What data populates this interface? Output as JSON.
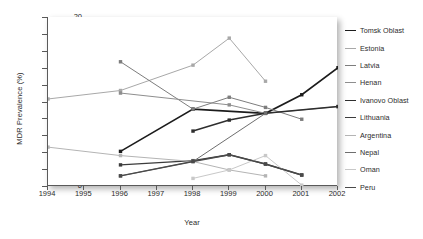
{
  "chart_data": {
    "type": "line",
    "title": "",
    "xlabel": "Year",
    "ylabel": "MDR Prevalence (%)",
    "xlim": [
      1994,
      2002
    ],
    "ylim": [
      0,
      20
    ],
    "ytick_step": 2,
    "yticks": [
      0,
      2,
      4,
      6,
      8,
      10,
      12,
      14,
      16,
      18,
      20
    ],
    "xticks": [
      1994,
      1995,
      1996,
      1997,
      1998,
      1999,
      2000,
      2001,
      2002
    ],
    "grid": false,
    "legend_position": "right",
    "marker": "square",
    "series": [
      {
        "name": "Tomsk Oblast",
        "color": "#1c1c1c",
        "width": 1.6,
        "points": [
          [
            1996,
            4.1
          ],
          [
            1998,
            9.1
          ],
          [
            2000,
            8.6
          ],
          [
            2001,
            10.8
          ],
          [
            2002,
            14.0
          ]
        ]
      },
      {
        "name": "Estonia",
        "color": "#a8a8a8",
        "width": 1.0,
        "points": [
          [
            1994,
            10.3
          ],
          [
            1996,
            11.3
          ],
          [
            1998,
            14.3
          ],
          [
            1999,
            17.5
          ],
          [
            2000,
            12.4
          ]
        ]
      },
      {
        "name": "Latvia",
        "color": "#7d7d7d",
        "width": 1.0,
        "points": [
          [
            1996,
            14.7
          ],
          [
            1998,
            9.1
          ],
          [
            1999,
            10.5
          ],
          [
            2000,
            9.3
          ],
          [
            2001,
            7.9
          ]
        ]
      },
      {
        "name": "Henan",
        "color": "#8e8e8e",
        "width": 1.0,
        "points": [
          [
            1996,
            11.0
          ],
          [
            1999,
            9.6
          ],
          [
            2000,
            8.6
          ],
          [
            2002,
            9.4
          ]
        ]
      },
      {
        "name": "Ivanovo Oblast",
        "color": "#2e2e2e",
        "width": 1.5,
        "points": [
          [
            1998,
            6.5
          ],
          [
            1999,
            7.8
          ],
          [
            2000,
            8.6
          ],
          [
            2002,
            9.4
          ]
        ]
      },
      {
        "name": "Lithuania",
        "color": "#3c3c3c",
        "width": 1.4,
        "points": [
          [
            1996,
            2.5
          ],
          [
            1998,
            3.0
          ],
          [
            1999,
            3.7
          ],
          [
            2000,
            2.6
          ],
          [
            2001,
            1.3
          ]
        ]
      },
      {
        "name": "Argentina",
        "color": "#b4b4b4",
        "width": 1.0,
        "points": [
          [
            1994,
            4.6
          ],
          [
            1996,
            3.6
          ],
          [
            1998,
            2.9
          ],
          [
            1999,
            1.9
          ],
          [
            2000,
            1.2
          ]
        ]
      },
      {
        "name": "Nepal",
        "color": "#6e6e6e",
        "width": 1.0,
        "points": [
          [
            1996,
            1.2
          ],
          [
            1998,
            2.9
          ],
          [
            2000,
            8.6
          ]
        ]
      },
      {
        "name": "Oman",
        "color": "#c8c8c8",
        "width": 1.0,
        "points": [
          [
            1998,
            0.9
          ],
          [
            1999,
            1.9
          ],
          [
            2000,
            3.6
          ],
          [
            2001,
            0.1
          ]
        ]
      },
      {
        "name": "Peru",
        "color": "#4a4a4a",
        "width": 1.3,
        "points": [
          [
            1996,
            1.2
          ],
          [
            1998,
            2.9
          ],
          [
            1999,
            3.7
          ],
          [
            2000,
            2.6
          ],
          [
            2001,
            1.3
          ]
        ]
      }
    ]
  },
  "axes": {
    "ylabel": "MDR Prevalence (%)",
    "xlabel": "Year",
    "ytick_labels": [
      "0",
      "2",
      "4",
      "6",
      "8",
      "10",
      "12",
      "14",
      "16",
      "18",
      "20"
    ],
    "xtick_labels": [
      "1994",
      "1995",
      "1996",
      "1997",
      "1998",
      "1999",
      "2000",
      "2001",
      "2002"
    ]
  },
  "legend": {
    "items": [
      {
        "label": "Tomsk Oblast",
        "color": "#1c1c1c",
        "width": 1.6
      },
      {
        "label": "Estonia",
        "color": "#a8a8a8",
        "width": 1.0
      },
      {
        "label": "Latvia",
        "color": "#7d7d7d",
        "width": 1.0
      },
      {
        "label": "Henan",
        "color": "#8e8e8e",
        "width": 1.0
      },
      {
        "label": "Ivanovo Oblast",
        "color": "#2e2e2e",
        "width": 1.5
      },
      {
        "label": "Lithuania",
        "color": "#3c3c3c",
        "width": 1.4
      },
      {
        "label": "Argentina",
        "color": "#b4b4b4",
        "width": 1.0
      },
      {
        "label": "Nepal",
        "color": "#6e6e6e",
        "width": 1.0
      },
      {
        "label": "Oman",
        "color": "#c8c8c8",
        "width": 1.0
      },
      {
        "label": "Peru",
        "color": "#4a4a4a",
        "width": 1.3
      }
    ]
  }
}
